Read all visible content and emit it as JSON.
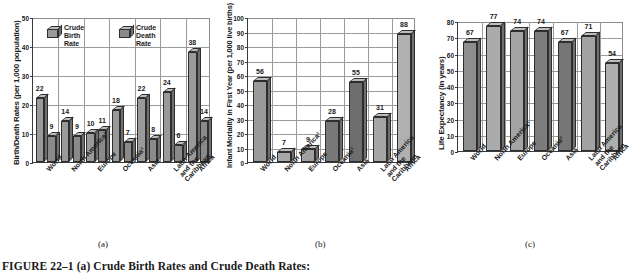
{
  "figure": {
    "caption": "FIGURE 22–1 (a) Crude Birth Rates and Crude Death Rates:",
    "sub_labels": {
      "a": "(a)",
      "b": "(b)",
      "c": "(c)"
    }
  },
  "categories": [
    "World",
    "North America¹",
    "Europe",
    "Oceania²",
    "Asia",
    "Latin America\nand the\nCaribbean",
    "Africa"
  ],
  "chart_data": [
    {
      "id": "a",
      "type": "bar",
      "title": "",
      "xlabel": "",
      "ylabel": "Birth/Death Rates (per 1,000 population)",
      "ylim": [
        0,
        50
      ],
      "ytick_step": 10,
      "yticks": [
        "0",
        "10",
        "20",
        "30",
        "40",
        "50"
      ],
      "grid": true,
      "legend_position": "top-inside",
      "categories": [
        "World",
        "North America¹",
        "Europe",
        "Oceania²",
        "Asia",
        "Latin America\nand the\nCaribbean",
        "Africa"
      ],
      "series": [
        {
          "name": "Crude Birth Rate",
          "values": [
            22,
            14,
            10,
            18,
            22,
            24,
            38
          ],
          "color": "#9a9a9a"
        },
        {
          "name": "Crude Death Rate",
          "values": [
            9,
            9,
            11,
            7,
            8,
            6,
            14
          ],
          "color": "#8a8a8a"
        }
      ]
    },
    {
      "id": "b",
      "type": "bar",
      "title": "",
      "xlabel": "",
      "ylabel": "Infant Mortality in First Year (per 1,000 live births)",
      "ylim": [
        0,
        100
      ],
      "ytick_step": 10,
      "yticks": [
        "0",
        "10",
        "20",
        "30",
        "40",
        "50",
        "60",
        "70",
        "80",
        "90",
        "100"
      ],
      "grid": true,
      "categories": [
        "World",
        "North America¹",
        "Europe",
        "Oceania²",
        "Asia",
        "Latin America\nand the\nCaribbean",
        "Africa"
      ],
      "values": [
        56,
        7,
        9,
        28,
        55,
        31,
        88
      ],
      "colors": [
        "#9a9a9a",
        "#a8a8a8",
        "#a0a0a0",
        "#787878",
        "#6e6e6e",
        "#a6a6a6",
        "#b0b0b0"
      ]
    },
    {
      "id": "c",
      "type": "bar",
      "title": "",
      "xlabel": "",
      "ylabel": "Life Expectancy (in years)",
      "ylim": [
        0,
        80
      ],
      "ytick_step": 10,
      "yticks": [
        "0",
        "10",
        "20",
        "30",
        "40",
        "50",
        "60",
        "70",
        "80"
      ],
      "grid": true,
      "categories": [
        "World",
        "North America¹",
        "Europe",
        "Oceania²",
        "Asia",
        "Latin America\nand the\nCaribbean",
        "Africa"
      ],
      "values": [
        67,
        77,
        74,
        74,
        67,
        71,
        54
      ],
      "colors": [
        "#8e8e8e",
        "#ababab",
        "#a4a4a4",
        "#7c7c7c",
        "#767676",
        "#a2a2a2",
        "#aeaeae"
      ]
    }
  ]
}
